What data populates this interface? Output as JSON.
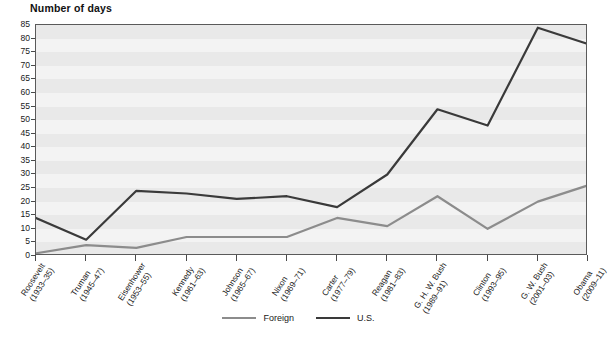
{
  "chart_data": {
    "type": "line",
    "title": "Number of days",
    "xlabel": "",
    "ylabel": "Number of days",
    "ylim": [
      0,
      85
    ],
    "ytick_step": 5,
    "yticks": [
      0,
      5,
      10,
      15,
      20,
      25,
      30,
      35,
      40,
      45,
      50,
      55,
      60,
      65,
      70,
      75,
      80,
      85
    ],
    "grid": true,
    "legend_position": "bottom-center",
    "categories": [
      "Roosevelt\n(1933–35)",
      "Truman\n(1945–47)",
      "Eisenhower\n(1953–55)",
      "Kennedy\n(1961–63)",
      "Johnson\n(1965–67)",
      "Nixon\n(1969–71)",
      "Carter\n(1977–79)",
      "Reagan\n(1981–83)",
      "G. H. W. Bush\n(1989–91)",
      "Clinton\n(1993–95)",
      "G. W. Bush\n(2001–03)",
      "Obama\n(2009–11)"
    ],
    "category_lines": [
      [
        "Roosevelt",
        "(1933–35)"
      ],
      [
        "Truman",
        "(1945–47)"
      ],
      [
        "Eisenhower",
        "(1953–55)"
      ],
      [
        "Kennedy",
        "(1961–63)"
      ],
      [
        "Johnson",
        "(1965–67)"
      ],
      [
        "Nixon",
        "(1969–71)"
      ],
      [
        "Carter",
        "(1977–79)"
      ],
      [
        "Reagan",
        "(1981–83)"
      ],
      [
        "G. H. W. Bush",
        "(1989–91)"
      ],
      [
        "Clinton",
        "(1993–95)"
      ],
      [
        "G. W. Bush",
        "(2001–03)"
      ],
      [
        "Obama",
        "(2009–11)"
      ]
    ],
    "series": [
      {
        "name": "Foreign",
        "color": "#8c8c8c",
        "values": [
          1,
          4,
          3,
          7,
          7,
          7,
          14,
          11,
          22,
          10,
          20,
          26
        ]
      },
      {
        "name": "U.S.",
        "color": "#3a3a3a",
        "values": [
          14,
          6,
          24,
          23,
          21,
          22,
          18,
          30,
          54,
          48,
          84,
          78
        ]
      }
    ]
  },
  "legend": {
    "entries": [
      {
        "label": "Foreign",
        "color": "#8c8c8c"
      },
      {
        "label": "U.S.",
        "color": "#3a3a3a"
      }
    ]
  },
  "colors": {
    "foreign": "#8c8c8c",
    "us": "#3a3a3a",
    "plot_background": "#f3f3f3",
    "band": "#e9e9e9",
    "axis": "#5a5a5a"
  }
}
